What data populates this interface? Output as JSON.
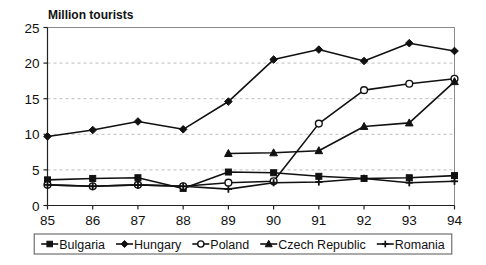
{
  "chart_data": {
    "type": "line",
    "title": "Million tourists",
    "xlabel": "",
    "ylabel": "",
    "x": [
      "85",
      "86",
      "87",
      "88",
      "89",
      "90",
      "91",
      "92",
      "93",
      "94"
    ],
    "categories": [
      "85",
      "86",
      "87",
      "88",
      "89",
      "90",
      "91",
      "92",
      "93",
      "94"
    ],
    "ylim": [
      0,
      25
    ],
    "yticks": [
      0,
      5,
      10,
      15,
      20,
      25
    ],
    "ytick_labels": [
      "0",
      "5",
      "10",
      "15",
      "20",
      "25"
    ],
    "grid": "horizontal-dashed",
    "legend_position": "bottom",
    "series": [
      {
        "name": "Bulgaria",
        "marker": "square",
        "values": [
          3.6,
          3.8,
          3.9,
          2.4,
          4.7,
          4.6,
          4.1,
          3.8,
          3.9,
          4.2
        ]
      },
      {
        "name": "Hungary",
        "marker": "diamond",
        "values": [
          9.7,
          10.6,
          11.8,
          10.7,
          14.6,
          20.5,
          21.9,
          20.3,
          22.8,
          21.7
        ]
      },
      {
        "name": "Poland",
        "marker": "circle-open",
        "values": [
          2.9,
          2.7,
          2.9,
          2.7,
          3.2,
          3.4,
          11.5,
          16.2,
          17.1,
          17.8
        ]
      },
      {
        "name": "Czech Republic",
        "marker": "triangle",
        "values": [
          null,
          null,
          null,
          null,
          7.3,
          7.4,
          7.7,
          11.1,
          11.6,
          17.4
        ]
      },
      {
        "name": "Romania",
        "marker": "plus",
        "values": [
          2.9,
          2.7,
          2.9,
          2.7,
          2.3,
          3.2,
          3.3,
          3.8,
          3.2,
          3.4
        ]
      }
    ],
    "legend": [
      {
        "label": "Bulgaria",
        "marker": "square"
      },
      {
        "label": "Hungary",
        "marker": "diamond"
      },
      {
        "label": "Poland",
        "marker": "circle-open"
      },
      {
        "label": "Czech Republic",
        "marker": "triangle"
      },
      {
        "label": "Romania",
        "marker": "plus"
      }
    ],
    "colors": {
      "line": "#111111",
      "grid": "#bdbdbd",
      "frame": "#8a8a8a",
      "background": "#ffffff"
    }
  }
}
